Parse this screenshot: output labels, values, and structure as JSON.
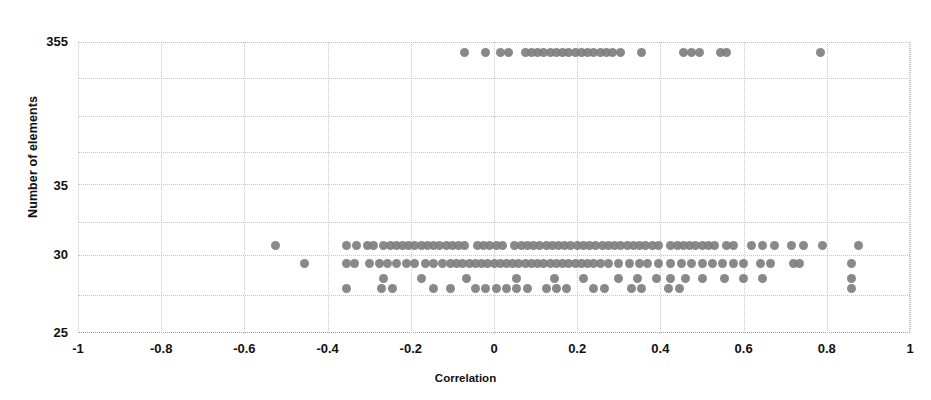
{
  "figure": {
    "partial_caption_above": "",
    "background_color": "#ffffff",
    "marker_color": "#7f7f7f",
    "grid_color": "#c8c8c8"
  },
  "axes": {
    "x_title": "Correlation",
    "y_title": "Number of elements",
    "x_ticks": [
      "-1",
      "-0.8",
      "-0.6",
      "-0.4",
      "-0.2",
      "0",
      "0.2",
      "0.4",
      "0.6",
      "0.8",
      "1"
    ],
    "y_ticks": [
      "355",
      "35",
      "30",
      "25"
    ]
  },
  "chart_data": {
    "type": "scatter",
    "title": "",
    "xlabel": "Correlation",
    "ylabel": "Number of elements",
    "xlim": [
      -1,
      1
    ],
    "ylim": [
      25,
      355
    ],
    "xticks": [
      -1,
      -0.8,
      -0.6,
      -0.4,
      -0.2,
      0,
      0.2,
      0.4,
      0.6,
      0.8,
      1
    ],
    "yticks": [
      355,
      35,
      30,
      25
    ],
    "y_scale": "nonlinear-categorical",
    "grid": true,
    "legend": null,
    "marker": {
      "shape": "circle",
      "color": "#7f7f7f",
      "size_px": 9
    },
    "note": "Points occupy discrete element-count levels: a top band at 355 and dense bands at 31, 30, 29 and 28.",
    "series": [
      {
        "name": "top-band-355",
        "y": 355,
        "x": [
          -0.07,
          -0.02,
          0.015,
          0.035,
          0.075,
          0.09,
          0.105,
          0.12,
          0.135,
          0.15,
          0.165,
          0.18,
          0.195,
          0.21,
          0.225,
          0.24,
          0.255,
          0.27,
          0.285,
          0.305,
          0.355,
          0.455,
          0.475,
          0.495,
          0.545,
          0.56,
          0.785
        ]
      },
      {
        "name": "band-31",
        "y": 31,
        "x": [
          -0.525,
          -0.355,
          -0.33,
          -0.305,
          -0.29,
          -0.265,
          -0.25,
          -0.235,
          -0.22,
          -0.205,
          -0.19,
          -0.175,
          -0.16,
          -0.145,
          -0.13,
          -0.115,
          -0.1,
          -0.085,
          -0.07,
          -0.04,
          -0.025,
          -0.01,
          0.005,
          0.02,
          0.05,
          0.065,
          0.08,
          0.095,
          0.11,
          0.125,
          0.14,
          0.155,
          0.17,
          0.185,
          0.2,
          0.215,
          0.23,
          0.245,
          0.26,
          0.275,
          0.29,
          0.305,
          0.32,
          0.335,
          0.35,
          0.365,
          0.38,
          0.395,
          0.425,
          0.44,
          0.455,
          0.47,
          0.485,
          0.5,
          0.515,
          0.53,
          0.56,
          0.575,
          0.62,
          0.645,
          0.675,
          0.715,
          0.745,
          0.79,
          0.875
        ]
      },
      {
        "name": "band-30",
        "y": 30,
        "x": [
          -0.455,
          -0.355,
          -0.335,
          -0.3,
          -0.275,
          -0.255,
          -0.235,
          -0.21,
          -0.19,
          -0.165,
          -0.145,
          -0.125,
          -0.105,
          -0.09,
          -0.075,
          -0.06,
          -0.045,
          -0.03,
          -0.015,
          0.0,
          0.015,
          0.03,
          0.045,
          0.06,
          0.075,
          0.09,
          0.105,
          0.12,
          0.135,
          0.15,
          0.165,
          0.18,
          0.195,
          0.21,
          0.225,
          0.24,
          0.255,
          0.275,
          0.3,
          0.325,
          0.35,
          0.37,
          0.395,
          0.425,
          0.45,
          0.475,
          0.5,
          0.525,
          0.55,
          0.575,
          0.6,
          0.64,
          0.665,
          0.72,
          0.735,
          0.86
        ]
      },
      {
        "name": "band-29",
        "y": 29,
        "x": [
          -0.265,
          -0.175,
          -0.065,
          0.055,
          0.145,
          0.215,
          0.3,
          0.345,
          0.39,
          0.425,
          0.46,
          0.5,
          0.555,
          0.6,
          0.645,
          0.86
        ]
      },
      {
        "name": "band-28",
        "y": 28,
        "x": [
          -0.355,
          -0.27,
          -0.245,
          -0.145,
          -0.105,
          -0.045,
          -0.02,
          0.005,
          0.03,
          0.055,
          0.08,
          0.125,
          0.15,
          0.175,
          0.24,
          0.265,
          0.33,
          0.355,
          0.42,
          0.445,
          0.86
        ]
      }
    ]
  }
}
